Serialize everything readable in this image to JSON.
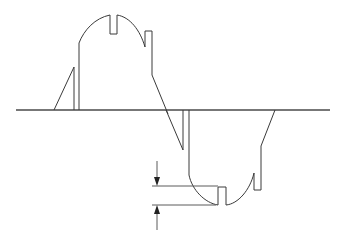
{
  "diagram": {
    "title": "",
    "colors": {
      "background": "#ffffff",
      "line": "#3a3a3a",
      "axis": "#4a4a4a"
    },
    "elements": [
      {
        "name": "zero-axis",
        "type": "horizontal-line"
      },
      {
        "name": "positive-half-cycle",
        "type": "waveform"
      },
      {
        "name": "negative-half-cycle",
        "type": "waveform"
      },
      {
        "name": "notch-depth-dimension",
        "type": "dimension-arrows"
      }
    ]
  }
}
